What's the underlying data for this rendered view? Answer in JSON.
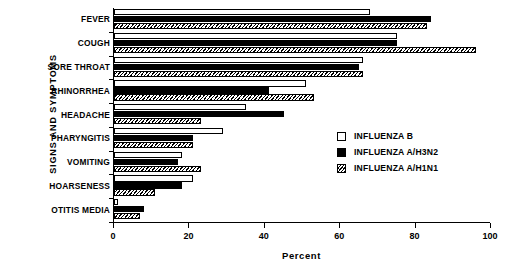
{
  "chart_data": {
    "type": "bar",
    "orientation": "horizontal",
    "title": "",
    "xlabel": "Percent",
    "ylabel": "SIGNS AND SYMPTOMS",
    "xlim": [
      0,
      100
    ],
    "xticks": [
      0,
      20,
      40,
      60,
      80,
      100
    ],
    "xtick_labels": [
      "0",
      "20",
      "40",
      "60",
      "80",
      "100"
    ],
    "grid": false,
    "legend_position": "center-right",
    "categories": [
      "FEVER",
      "COUGH",
      "SORE THROAT",
      "RHINORRHEA",
      "HEADACHE",
      "PHARYNGITIS",
      "VOMITING",
      "HOARSENESS",
      "OTITIS MEDIA"
    ],
    "series": [
      {
        "name": "INFLUENZA B",
        "fill": "white",
        "values": [
          68,
          75,
          66,
          51,
          35,
          29,
          18,
          21,
          1
        ]
      },
      {
        "name": "INFLUENZA A/H3N2",
        "fill": "black",
        "values": [
          84,
          75,
          65,
          41,
          45,
          21,
          17,
          18,
          8
        ]
      },
      {
        "name": "INFLUENZA A/H1N1",
        "fill": "hatched",
        "values": [
          83,
          96,
          66,
          53,
          23,
          21,
          23,
          11,
          7
        ]
      }
    ]
  },
  "legend": {
    "items": [
      {
        "label": "INFLUENZA B",
        "swatch": "white-square-icon"
      },
      {
        "label": "INFLUENZA A/H3N2",
        "swatch": "black-square-icon"
      },
      {
        "label": "INFLUENZA A/H1N1",
        "swatch": "hatched-square-icon"
      }
    ]
  }
}
